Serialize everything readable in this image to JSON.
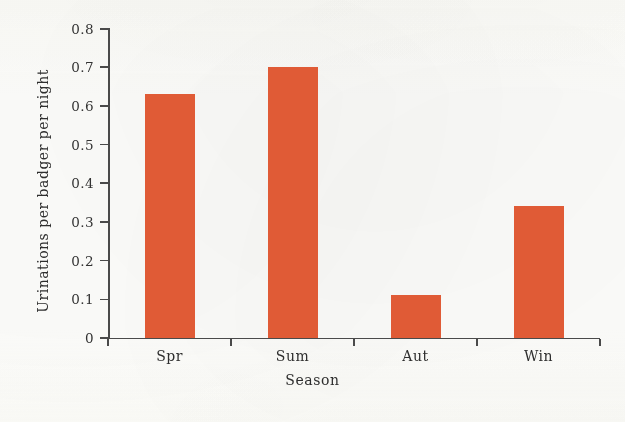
{
  "chart_data": {
    "type": "bar",
    "title": "",
    "categories": [
      "Spr",
      "Sum",
      "Aut",
      "Win"
    ],
    "values": [
      0.63,
      0.7,
      0.11,
      0.34
    ],
    "xlabel": "Season",
    "ylabel": "Urinations per badger per night",
    "ylim": [
      0,
      0.8
    ],
    "ytick_labels": [
      "0",
      "0.1",
      "0.2",
      "0.3",
      "0.4",
      "0.5",
      "0.6",
      "0.7",
      "0.8"
    ],
    "ytick_values": [
      0,
      0.1,
      0.2,
      0.3,
      0.4,
      0.5,
      0.6,
      0.7,
      0.8
    ],
    "grid": false,
    "legend": false,
    "bar_color": "#e05b36",
    "axis_color": "#4a4a4a",
    "background_color": "#fdfdfb"
  }
}
